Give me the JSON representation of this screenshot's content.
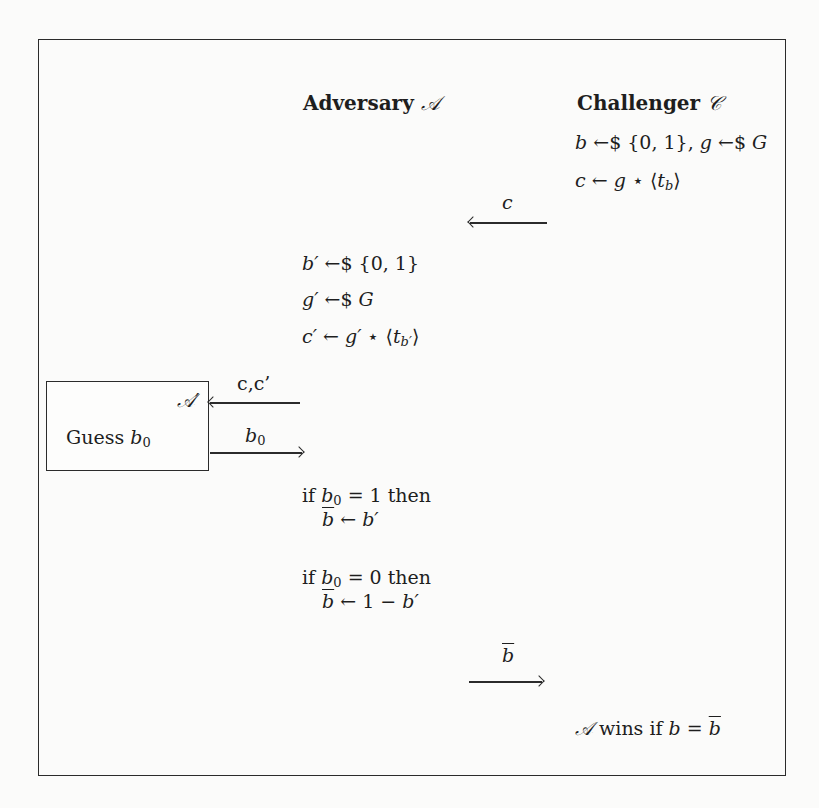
{
  "diagram": {
    "type": "security-game-protocol",
    "parties": {
      "adversary": {
        "label": "Adversary",
        "symbol": "𝒜"
      },
      "challenger": {
        "label": "Challenger",
        "symbol": "𝒞"
      }
    },
    "challenger_setup": [
      "b ←$ {0,1},  g ←$ G",
      "c ← g ⋆ ⟨t_b⟩"
    ],
    "messages": [
      {
        "label": "c",
        "direction": "challenger-to-adversary"
      },
      {
        "label": "c,c’",
        "direction": "adversary-to-subadversary"
      },
      {
        "label": "b0",
        "direction": "subadversary-to-adversary"
      },
      {
        "label": "b̄",
        "direction": "adversary-to-challenger"
      }
    ],
    "adversary_steps": [
      "b′ ←$ {0,1}",
      "g′ ←$ G",
      "c′ ← g′ ⋆ ⟨t_b′⟩"
    ],
    "sub_adversary": {
      "symbol": "𝒜′",
      "action": "Guess"
    },
    "decision": {
      "if1": "if b0 = 1 then",
      "then1": "b̄ ← b′",
      "if0": "if b0 = 0 then",
      "then0": "b̄ ← 1 − b′"
    },
    "win_condition": "𝒜 wins if b = b̄"
  },
  "text": {
    "adv_title": "Adversary ",
    "adv_sym": "𝒜",
    "chal_title": "Challenger ",
    "chal_sym": "𝒞",
    "setup1_b": "b",
    "setup1_rest": " ←$ {0, 1},  ",
    "setup1_g": "g",
    "setup1_rest2": " ←$ ",
    "setup1_G": "G",
    "setup2_c": "c",
    "setup2_arrow": " ← ",
    "setup2_g": "g",
    "setup2_star": " ⋆ ⟨",
    "setup2_t": "t",
    "setup2_sub": "b",
    "setup2_close": "⟩",
    "msg_c": "c",
    "step1_b": "b′",
    "step1_rest": " ←$ {0, 1}",
    "step2_g": "g′",
    "step2_rest": " ←$ ",
    "step2_G": "G",
    "step3_c": "c′",
    "step3_arrow": " ← ",
    "step3_g": "g′",
    "step3_star": " ⋆ ⟨",
    "step3_t": "t",
    "step3_sub": "b′",
    "step3_close": "⟩",
    "sub_adv": "𝒜′",
    "msg_cc": "c,c’",
    "guess": "Guess ",
    "b0_b": "b",
    "b0_sub": "0",
    "if_kw": "if ",
    "eq1_rest": " = 1 then",
    "eq0_rest": " = 0 then",
    "bbar": "b",
    "assign1_rest": " ← ",
    "assign1_b": "b′",
    "assign0_rest": " ← 1 − ",
    "assign0_b": "b′",
    "msg_bbar": "b",
    "win_sym": "𝒜",
    "win_text": " wins if ",
    "win_b": "b",
    "win_eq": " = ",
    "win_bbar": "b"
  }
}
